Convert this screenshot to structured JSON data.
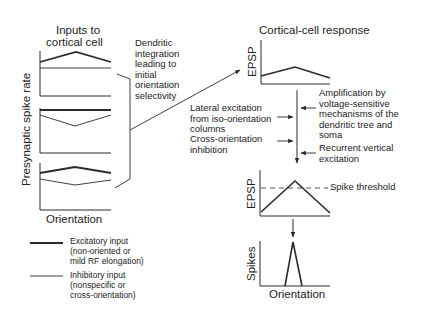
{
  "left_panel": {
    "title_line1": "Inputs to",
    "title_line2": "cortical cell",
    "y_axis_label": "Presynaptic spike rate",
    "x_axis_label": "Orientation",
    "bracket_label": [
      "Dendritic",
      "integration",
      "leading to",
      "initial",
      "orientation",
      "selectivity"
    ]
  },
  "legend": {
    "excitatory": [
      "Excitatory input",
      "(non-oriented or",
      "mild RF elongation)"
    ],
    "inhibitory": [
      "Inhibitory input",
      "(nonspecific or",
      "cross-orientation)"
    ]
  },
  "right_panel": {
    "title": "Cortical-cell response",
    "epsp_label_1": "EPSP",
    "epsp_label_2": "EPSP",
    "spikes_label": "Spikes",
    "x_axis_label": "Orientation",
    "spike_threshold_label": "Spike threshold",
    "left_inputs": [
      [
        "Lateral excitation",
        "from iso-orientation",
        "columns"
      ],
      [
        "Cross-orientation",
        "inhibition"
      ]
    ],
    "right_inputs": [
      [
        "Amplification by",
        "voltage-sensitive",
        "mechanisms of the",
        "dendritic tree and",
        "soma"
      ],
      [
        "Recurrent vertical",
        "excitation"
      ]
    ]
  },
  "colors": {
    "line": "#2a2a2a",
    "background": "#ffffff"
  }
}
